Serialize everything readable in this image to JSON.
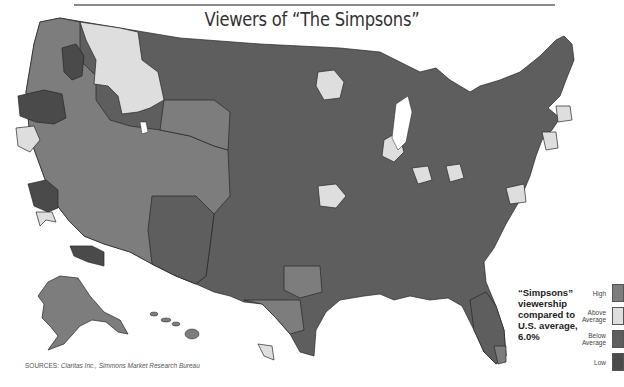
{
  "title": "Viewers of “The Simpsons”",
  "note_lines": [
    "“Simpsons”",
    "viewership",
    "compared to",
    "U.S. average,",
    "6.0%"
  ],
  "legend": {
    "items": [
      {
        "label_lines": [
          "High"
        ],
        "color": "#7d7d7d",
        "category": "high"
      },
      {
        "label_lines": [
          "Above",
          "Average"
        ],
        "color": "#dedede",
        "category": "above-average"
      },
      {
        "label_lines": [
          "Below",
          "Average"
        ],
        "color": "#5e5e5e",
        "category": "below-average"
      },
      {
        "label_lines": [
          "Low"
        ],
        "color": "#4a4a4a",
        "category": "low"
      }
    ]
  },
  "sources": {
    "label": "SOURCES:",
    "text": "Claritas Inc., Simmons Market Research Bureau"
  },
  "map": {
    "us_average_percent": 6.0,
    "category_colors": {
      "high": "#7d7d7d",
      "above-average": "#dedede",
      "below-average": "#5e5e5e",
      "low": "#4a4a4a"
    }
  }
}
